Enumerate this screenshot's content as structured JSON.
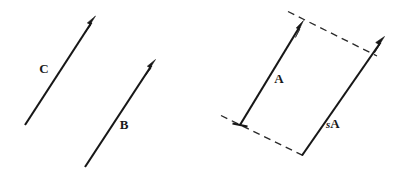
{
  "figure": {
    "background_color": "#ffffff",
    "stroke_color": "#171717",
    "dash_color": "#2a2a2a",
    "width": 405,
    "height": 178,
    "panels": [
      {
        "name": "left-panel",
        "description": "Two parallel vectors of unequal length",
        "vectors": [
          {
            "id": "vector-c",
            "label": "C",
            "label_prefix": "",
            "style": "solid",
            "has_arrowhead": true,
            "has_tail_cap": false,
            "x1": 25,
            "y1": 125,
            "x2": 95,
            "y2": 17,
            "label_x": 44,
            "label_y": 69
          },
          {
            "id": "vector-b",
            "label": "B",
            "label_prefix": "",
            "style": "solid",
            "has_arrowhead": true,
            "has_tail_cap": false,
            "x1": 85,
            "y1": 167,
            "x2": 155,
            "y2": 60,
            "label_x": 124,
            "label_y": 125
          }
        ]
      },
      {
        "name": "right-panel",
        "description": "Vector A and its scalar multiple sA forming a parallelogram with dashed guides",
        "vectors": [
          {
            "id": "vector-a",
            "label": "A",
            "label_prefix": "",
            "style": "solid",
            "has_arrowhead": true,
            "has_tail_cap": true,
            "x1": 240,
            "y1": 125,
            "x2": 303,
            "y2": 21,
            "label_x": 279,
            "label_y": 79
          },
          {
            "id": "vector-sa",
            "label": "A",
            "label_prefix": "s",
            "style": "solid",
            "has_arrowhead": true,
            "has_tail_cap": false,
            "x1": 302,
            "y1": 155,
            "x2": 384,
            "y2": 37,
            "label_x": 334,
            "label_y": 124
          }
        ],
        "guides": [
          {
            "id": "guide-top",
            "style": "dashed",
            "x1": 288,
            "y1": 12,
            "x2": 377,
            "y2": 56
          },
          {
            "id": "guide-bottom",
            "style": "dashed",
            "x1": 221,
            "y1": 116,
            "x2": 306,
            "y2": 157
          }
        ]
      }
    ]
  },
  "labels": {
    "c": "C",
    "b": "B",
    "a": "A",
    "sa_scalar": "s",
    "sa_vector": "A"
  }
}
